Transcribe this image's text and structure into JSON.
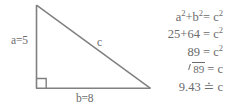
{
  "figure": {
    "type": "right-triangle",
    "line_color": "#808080",
    "text_color": "#6b6b6b",
    "background": "#ffffff",
    "vertices": {
      "apex": [
        36,
        5
      ],
      "right_angle": [
        36,
        88
      ],
      "right": [
        150,
        88
      ]
    },
    "right_angle_marker": true,
    "labels": {
      "leg_a": "a=5",
      "leg_b": "b=8",
      "hypotenuse": "c"
    },
    "values": {
      "a": 5,
      "b": 8,
      "c": 9.43
    }
  },
  "equations": {
    "lines": [
      {
        "id": "pythagorean-identity",
        "text": "a²+b²= c²"
      },
      {
        "id": "substituted-squares",
        "text": "25+64 = c²"
      },
      {
        "id": "summed-squares",
        "text": "89 = c²"
      },
      {
        "id": "square-root-step",
        "text": "√89 = c"
      },
      {
        "id": "approx-result",
        "text": "9.43 ≐ c"
      }
    ],
    "parts": {
      "line1": {
        "lhs_a": "a",
        "exp_a": "2",
        "plus": "+",
        "lhs_b": "b",
        "exp_b": "2",
        "eq": "= ",
        "rhs": "c",
        "exp_c": "2"
      },
      "line2": {
        "lhs": "25+64 = ",
        "rhs": "c",
        "exp": "2"
      },
      "line3": {
        "lhs": "89 = ",
        "rhs": "c",
        "exp": "2"
      },
      "line4": {
        "radicand": "89",
        "eq": " = c"
      },
      "line5": {
        "value": "9.43",
        "rel": "≐",
        "rhs": "c"
      }
    }
  }
}
